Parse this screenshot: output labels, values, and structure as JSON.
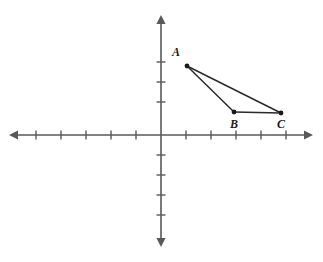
{
  "figure": {
    "background_color": "#ffffff",
    "width": 323,
    "height": 262
  },
  "colors": {
    "axis": "#59595b",
    "segment": "#2b2b2b",
    "vertex": "#1a1a1a",
    "label": "#1a1a1a",
    "background": "#ffffff"
  },
  "axes": {
    "origin": {
      "px_x": 161,
      "px_y": 135
    },
    "unit_px_x": 25,
    "unit_px_y": 20,
    "x_axis": {
      "name": "x-axis",
      "px_y": 135,
      "px_x_start": 9,
      "px_x_end": 313,
      "arrow_left": true,
      "arrow_right": true,
      "tick_length_px": 9,
      "ticks_px_x": [
        36,
        61,
        86,
        111,
        136,
        186,
        211,
        236,
        261,
        286
      ],
      "tick_values": [
        -5,
        -4,
        -3,
        -2,
        -1,
        1,
        2,
        3,
        4,
        5
      ]
    },
    "y_axis": {
      "name": "y-axis",
      "px_x": 161,
      "px_y_start": 15,
      "px_y_end": 247,
      "arrow_up": true,
      "arrow_down": true,
      "tick_length_px": 9,
      "ticks_px_y": [
        62,
        82,
        102,
        155,
        175,
        195,
        215
      ],
      "tick_values": [
        3.5,
        2.5,
        1.5,
        -1,
        -2,
        -3,
        -4
      ]
    }
  },
  "chart_data": {
    "type": "scatter",
    "title": "",
    "xlabel": "",
    "ylabel": "",
    "grid": false,
    "legend": null,
    "xlim": [
      -6.1,
      6.1
    ],
    "ylim": [
      -5.6,
      6.0
    ],
    "points": [
      {
        "label": "A",
        "x": 1.0,
        "y": 3.45,
        "px_x": 187,
        "px_y": 66,
        "label_px_x": 180,
        "label_px_y": 56,
        "label_anchor": "end"
      },
      {
        "label": "B",
        "x": 2.9,
        "y": 1.15,
        "px_x": 234,
        "px_y": 112,
        "label_px_x": 234,
        "label_px_y": 128,
        "label_anchor": "middle"
      },
      {
        "label": "C",
        "x": 4.8,
        "y": 1.1,
        "px_x": 281,
        "px_y": 113,
        "label_px_x": 281,
        "label_px_y": 128,
        "label_anchor": "middle"
      }
    ],
    "segments": [
      {
        "name": "AB",
        "from": "A",
        "to": "B"
      },
      {
        "name": "BC",
        "from": "B",
        "to": "C"
      },
      {
        "name": "CA",
        "from": "C",
        "to": "A"
      }
    ]
  }
}
